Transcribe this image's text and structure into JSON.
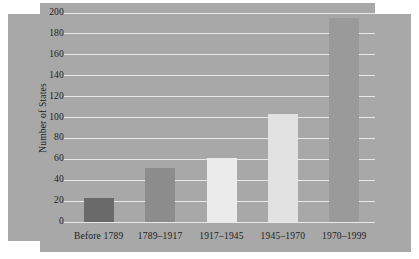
{
  "chart_data": {
    "type": "bar",
    "title": "",
    "subtitle": "",
    "xlabel": "",
    "ylabel": "Number of States",
    "categories": [
      "Before 1789",
      "1789–1917",
      "1917–1945",
      "1945–1970",
      "1970–1999"
    ],
    "values": [
      23,
      52,
      61,
      103,
      195
    ],
    "ylim": [
      0,
      200
    ],
    "ytick_labels": [
      "0",
      "20",
      "40",
      "60",
      "80",
      "100",
      "120",
      "140",
      "160",
      "180",
      "200"
    ],
    "ytick_values": [
      0,
      20,
      40,
      60,
      80,
      100,
      120,
      140,
      160,
      180,
      200
    ],
    "grid": true,
    "legend": "none",
    "bar_colors": [
      "#6a6a6a",
      "#8c8c8c",
      "#ebebeb",
      "#e2e2e2",
      "#9a9a9a"
    ],
    "plot_background": "#a8a8a8",
    "gridline_color": "#e9e9e9",
    "series": [
      {
        "name": "Number of States",
        "values": [
          23,
          52,
          61,
          103,
          195
        ]
      }
    ]
  }
}
